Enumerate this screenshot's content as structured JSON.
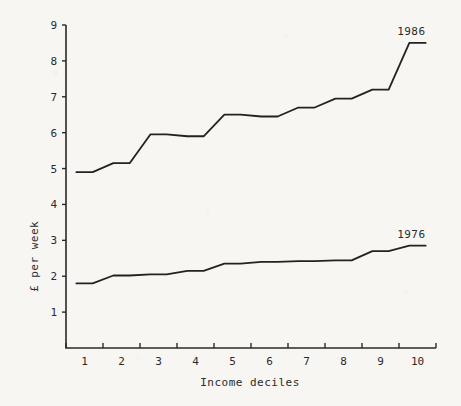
{
  "chart_data": {
    "type": "line",
    "title": "",
    "xlabel": "Income deciles",
    "ylabel": "£ per week",
    "categories": [
      "1",
      "2",
      "3",
      "4",
      "5",
      "6",
      "7",
      "8",
      "9",
      "10"
    ],
    "xlim": [
      0.5,
      10.5
    ],
    "ylim": [
      0,
      9
    ],
    "ytick_labels": [
      "1",
      "2",
      "3",
      "4",
      "5",
      "6",
      "7",
      "8",
      "9"
    ],
    "ytick_values": [
      1,
      2,
      3,
      4,
      5,
      6,
      7,
      8,
      9
    ],
    "xtick_labels": [
      "1",
      "2",
      "3",
      "4",
      "5",
      "6",
      "7",
      "8",
      "9",
      "10"
    ],
    "grid": false,
    "legend_position": "line-end-labels",
    "series": [
      {
        "name": "1986",
        "label": "1986",
        "color": "#222222",
        "values": [
          4.9,
          5.15,
          5.95,
          5.9,
          6.5,
          6.45,
          6.7,
          6.95,
          7.2,
          8.5
        ]
      },
      {
        "name": "1976",
        "label": "1976",
        "color": "#222222",
        "values": [
          1.8,
          2.02,
          2.05,
          2.15,
          2.35,
          2.4,
          2.42,
          2.44,
          2.7,
          2.85
        ]
      }
    ],
    "annotations": [
      {
        "text": "1986",
        "series": "1986",
        "at_category": "10"
      },
      {
        "text": "1976",
        "series": "1976",
        "at_category": "10"
      }
    ]
  }
}
